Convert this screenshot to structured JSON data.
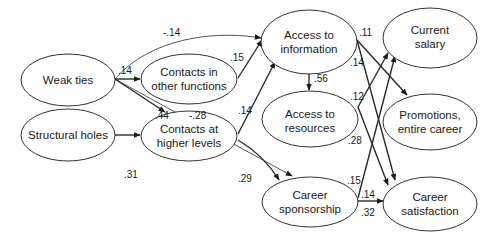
{
  "diagram": {
    "type": "path-diagram",
    "nodes": {
      "weak_ties": {
        "lines": [
          "Weak ties"
        ]
      },
      "structural_holes": {
        "lines": [
          "Structural holes"
        ]
      },
      "contacts_other_functions": {
        "lines": [
          "Contacts in",
          "other functions"
        ]
      },
      "contacts_higher_levels": {
        "lines": [
          "Contacts at",
          "higher levels"
        ]
      },
      "access_information": {
        "lines": [
          "Access to",
          "information"
        ]
      },
      "access_resources": {
        "lines": [
          "Access to",
          "resources"
        ]
      },
      "career_sponsorship": {
        "lines": [
          "Career",
          "sponsorship"
        ]
      },
      "current_salary": {
        "lines": [
          "Current",
          "salary"
        ]
      },
      "promotions": {
        "lines": [
          "Promotions,",
          "entire career"
        ]
      },
      "career_satisfaction": {
        "lines": [
          "Career",
          "satisfaction"
        ]
      }
    },
    "edges": [
      {
        "from": "Weak ties",
        "to": "Access to information",
        "coef": "-.14"
      },
      {
        "from": "Weak ties",
        "to": "Contacts in other functions",
        "coef": ".14"
      },
      {
        "from": "Weak ties",
        "to": "Contacts at higher levels",
        "coef": ".44"
      },
      {
        "from": "Weak ties",
        "to": "Career sponsorship",
        "coef": "-.28"
      },
      {
        "from": "Structural holes",
        "to": "Contacts at higher levels",
        "coef": ".31"
      },
      {
        "from": "Contacts in other functions",
        "to": "Access to information",
        "coef": ".15"
      },
      {
        "from": "Contacts at higher levels",
        "to": "Access to information",
        "coef": ".14"
      },
      {
        "from": "Contacts at higher levels",
        "to": "Career sponsorship",
        "coef": ".29"
      },
      {
        "from": "Access to information",
        "to": "Access to resources",
        "coef": ".56"
      },
      {
        "from": "Access to information",
        "to": "Promotions, entire career",
        "coef": ".11"
      },
      {
        "from": "Access to information",
        "to": "Career satisfaction",
        "coef": ".14"
      },
      {
        "from": "Access to resources",
        "to": "Current salary",
        "coef": ".12"
      },
      {
        "from": "Access to resources",
        "to": "Career satisfaction",
        "coef": ".28"
      },
      {
        "from": "Career sponsorship",
        "to": "Current salary",
        "coef": ".15"
      },
      {
        "from": "Career sponsorship",
        "to": "Promotions, entire career",
        "coef": ".14"
      },
      {
        "from": "Career sponsorship",
        "to": "Career satisfaction",
        "coef": ".32"
      }
    ],
    "labels": {
      "wt_ai": "-.14",
      "wt_cof": ".14",
      "wt_chl": ".44",
      "wt_cs": "-.28",
      "sh_chl": ".31",
      "cof_ai": ".15",
      "chl_ai": ".14",
      "chl_cs": ".29",
      "ai_ar": ".56",
      "ai_pr": ".11",
      "ai_sat": ".14",
      "ar_sal": ".12",
      "ar_sat": ".28",
      "cs_sal": ".15",
      "cs_pr": ".14",
      "cs_sat": ".32"
    }
  }
}
